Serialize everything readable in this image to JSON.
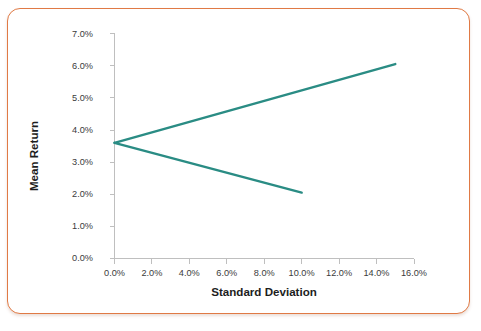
{
  "frame": {
    "border_color": "#e07a45",
    "background": "#ffffff"
  },
  "chart_data": {
    "type": "line",
    "title": "",
    "xlabel": "Standard Deviation",
    "ylabel": "Mean Return",
    "xlim": [
      0,
      16
    ],
    "ylim": [
      0,
      7
    ],
    "xtick_labels": [
      "0.0%",
      "2.0%",
      "4.0%",
      "6.0%",
      "8.0%",
      "10.0%",
      "12.0%",
      "14.0%",
      "16.0%"
    ],
    "xtick_values": [
      0,
      2,
      4,
      6,
      8,
      10,
      12,
      14,
      16
    ],
    "ytick_labels": [
      "0.0%",
      "1.0%",
      "2.0%",
      "3.0%",
      "4.0%",
      "5.0%",
      "6.0%",
      "7.0%"
    ],
    "ytick_values": [
      0,
      1,
      2,
      3,
      4,
      5,
      6,
      7
    ],
    "grid": false,
    "legend": "none",
    "series_color": "#2a8c84",
    "series": [
      {
        "name": "efficient-frontier-upper",
        "x": [
          0,
          15
        ],
        "y": [
          3.6,
          6.05
        ]
      },
      {
        "name": "efficient-frontier-lower",
        "x": [
          0,
          10
        ],
        "y": [
          3.6,
          2.05
        ]
      }
    ]
  }
}
